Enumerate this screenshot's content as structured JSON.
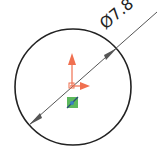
{
  "sketch": {
    "entity": "circle",
    "dimension": {
      "symbol": "Ø",
      "value": "7.8",
      "label": "Ø7.8"
    },
    "colors": {
      "circle": "#222222",
      "dimension_line": "#555555",
      "axis_y": "#f07050",
      "axis_x": "#f07050",
      "origin_marker": "#5cb85c",
      "origin_marker_inner": "#3a7fc1"
    },
    "icons": [
      "origin-axes-icon",
      "center-point-marker-icon"
    ]
  }
}
